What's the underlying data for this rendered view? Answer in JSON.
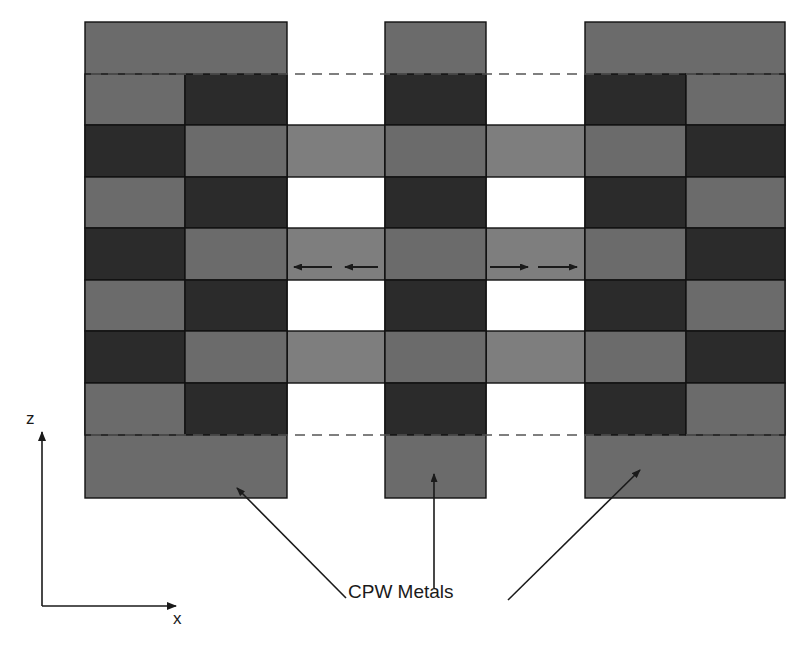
{
  "diagram": {
    "type": "CPW slow-wave structure cross-section",
    "labels": {
      "metals": "CPW Metals",
      "axis_z": "z",
      "axis_x": "x"
    },
    "colors": {
      "metal": "#6b6b6b",
      "dark_block": "#2b2b2b",
      "connector": "#7e7e7e",
      "gap": "#ffffff",
      "border": "#111111",
      "dashed": "#555555",
      "arrow": "#1a1a1a"
    },
    "geometry": {
      "top": 22,
      "bottom": 498,
      "dashed_top_y": 74,
      "dashed_bottom_y": 435,
      "row_edges": [
        74,
        125,
        177,
        228,
        280,
        331,
        383,
        435
      ],
      "columns": {
        "left_metal": [
          85,
          287
        ],
        "left_inner_split": 185,
        "center_metal": [
          385,
          486
        ],
        "right_metal": [
          585,
          785
        ],
        "right_inner_split": 686
      },
      "connector_rows": [
        1,
        3,
        5
      ]
    },
    "field_arrows": {
      "left": "leftward",
      "right": "rightward",
      "row_y": 267
    }
  }
}
